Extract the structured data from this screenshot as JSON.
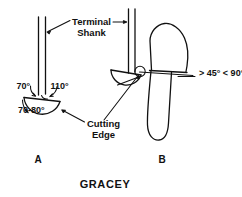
{
  "figure": {
    "title": "GRACEY",
    "panels": [
      {
        "id": "A",
        "label": "A"
      },
      {
        "id": "B",
        "label": "B"
      }
    ],
    "callouts": {
      "terminal_shank_line1": "Terminal",
      "terminal_shank_line2": "Shank",
      "cutting_edge_line1": "Cutting",
      "cutting_edge_line2": "Edge"
    },
    "angles": {
      "upper_left": "70°",
      "upper_right": "110°",
      "lower": "70-80°",
      "tooth_range": "> 45°  < 90°"
    },
    "colors": {
      "ink": "#111111",
      "background": "#ffffff"
    }
  }
}
